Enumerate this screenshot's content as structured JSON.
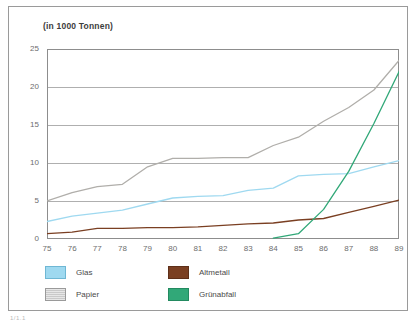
{
  "figure": {
    "title": "(in 1000 Tonnen)",
    "caption": "1/1.1"
  },
  "legend": {
    "items": [
      {
        "label": "Glas",
        "color": "#9fd9f0",
        "swatch": "sw-glas"
      },
      {
        "label": "Papier",
        "color": "#c9c9c9",
        "swatch": "sw-papier"
      },
      {
        "label": "Altmetall",
        "color": "#7a3f22",
        "swatch": "sw-altmetall"
      },
      {
        "label": "Grünabfall",
        "color": "#31a878",
        "swatch": "sw-gruenabfall"
      }
    ]
  },
  "axes": {
    "y_ticks": [
      "0",
      "5",
      "10",
      "15",
      "20",
      "25"
    ],
    "x_ticks": [
      "75",
      "76",
      "77",
      "78",
      "79",
      "80",
      "81",
      "82",
      "83",
      "84",
      "85",
      "86",
      "87",
      "88",
      "89"
    ]
  },
  "chart_data": {
    "type": "line",
    "title": "(in 1000 Tonnen)",
    "xlabel": "",
    "ylabel": "in 1000 Tonnen",
    "xlim": [
      75,
      89
    ],
    "ylim": [
      0,
      25
    ],
    "ytick_values": [
      0,
      5,
      10,
      15,
      20,
      25
    ],
    "grid": "horizontal",
    "legend_position": "below-plot",
    "categories": [
      75,
      76,
      77,
      78,
      79,
      80,
      81,
      82,
      83,
      84,
      85,
      86,
      87,
      88,
      89
    ],
    "series": [
      {
        "name": "Glas",
        "color": "#9fd9f0",
        "values": [
          2.3,
          3.0,
          3.4,
          3.8,
          4.6,
          5.4,
          5.6,
          5.7,
          6.4,
          6.7,
          8.3,
          8.5,
          8.6,
          9.5,
          10.3
        ]
      },
      {
        "name": "Papier",
        "color": "#b0aeaa",
        "values": [
          5.0,
          6.1,
          6.9,
          7.2,
          9.5,
          10.6,
          10.6,
          10.7,
          10.7,
          12.3,
          13.4,
          15.5,
          17.3,
          19.6,
          23.5
        ]
      },
      {
        "name": "Altmetall",
        "color": "#7a3f22",
        "values": [
          0.7,
          0.9,
          1.4,
          1.4,
          1.5,
          1.5,
          1.6,
          1.8,
          2.0,
          2.1,
          2.5,
          2.7,
          3.5,
          4.3,
          5.1
        ]
      },
      {
        "name": "Grünabfall",
        "color": "#31a878",
        "values": [
          null,
          null,
          null,
          null,
          null,
          null,
          null,
          null,
          null,
          0.1,
          0.7,
          3.9,
          8.9,
          15.2,
          22.0
        ]
      }
    ]
  }
}
